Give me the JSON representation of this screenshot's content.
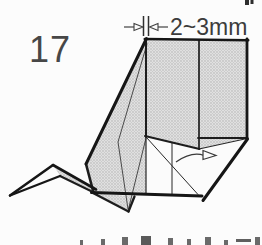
{
  "diagram": {
    "step_number": "17",
    "measurement_label": "2~3mm",
    "colors": {
      "line": "#1d1d1d",
      "paper_gray_fill": "#dcdcdc",
      "halftone_dot": "#a9a9a9",
      "annotation": "#414141",
      "background": "#fcfcfc"
    },
    "icons": {
      "measure_arrow_right": "open-arrowhead-pointing-right",
      "measure_arrow_left": "open-arrowhead-pointing-left",
      "gap_ticks": "double-vertical-tick-marks",
      "fold_arrow": "curved-open-arrow-pointing-right"
    },
    "notes": {
      "bottom_edge": "tops of cropped caption characters",
      "top_right_corner": "cropped dark mark"
    }
  }
}
